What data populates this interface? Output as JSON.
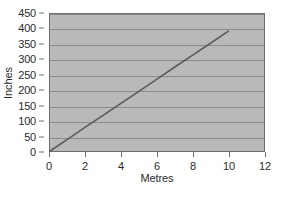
{
  "chart_data": {
    "type": "line",
    "title": "",
    "xlabel": "Metres",
    "ylabel": "Inches",
    "xlim": [
      0,
      12
    ],
    "ylim": [
      0,
      450
    ],
    "xticks": [
      0,
      2,
      4,
      6,
      8,
      10,
      12
    ],
    "yticks": [
      0,
      50,
      100,
      150,
      200,
      250,
      300,
      350,
      400,
      450
    ],
    "xtick_labels": [
      "0",
      "2",
      "4",
      "6",
      "8",
      "10",
      "12"
    ],
    "ytick_labels": [
      "0",
      "50",
      "100",
      "150",
      "200",
      "250",
      "300",
      "350",
      "400",
      "450"
    ],
    "grid": "horizontal",
    "legend": "none",
    "series": [
      {
        "name": "metres-to-inches",
        "x": [
          0,
          10
        ],
        "values": [
          0,
          394
        ],
        "points": [
          {
            "x": 0,
            "y": 0
          },
          {
            "x": 1,
            "y": 39
          },
          {
            "x": 2,
            "y": 79
          },
          {
            "x": 3,
            "y": 118
          },
          {
            "x": 4,
            "y": 157
          },
          {
            "x": 5,
            "y": 197
          },
          {
            "x": 6,
            "y": 236
          },
          {
            "x": 7,
            "y": 276
          },
          {
            "x": 8,
            "y": 315
          },
          {
            "x": 9,
            "y": 354
          },
          {
            "x": 10,
            "y": 394
          }
        ],
        "color": "#5a5a5a",
        "line_width": 1.6
      }
    ]
  },
  "style": {
    "plot_background": "#b9b9b9",
    "page_background": "#ffffff",
    "gridline_color": "#8c8c8c",
    "axis_color": "#6e6e6e",
    "text_color": "#2b2b2b",
    "series_color": "#5a5a5a"
  }
}
